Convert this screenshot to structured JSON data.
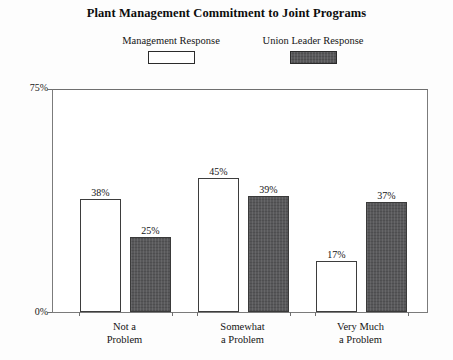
{
  "chart_data": {
    "type": "bar",
    "title": "Plant Management Commitment to Joint Programs",
    "xlabel": "",
    "ylabel": "",
    "ylim": [
      0,
      75
    ],
    "grid": false,
    "legend_position": "top",
    "categories": [
      "Not a Problem",
      "Somewhat a Problem",
      "Very Much a Problem"
    ],
    "category_lines": [
      [
        "Not a",
        "Problem"
      ],
      [
        "Somewhat",
        "a Problem"
      ],
      [
        "Very Much",
        "a Problem"
      ]
    ],
    "y_ticks": [
      "0%",
      "75%"
    ],
    "y_tick_values": [
      0,
      75
    ],
    "series": [
      {
        "name": "Management Response",
        "values": [
          38,
          45,
          17
        ],
        "labels": [
          "38%",
          "45%",
          "17%"
        ],
        "fill": "#ffffff",
        "stroke": "#3d3d3d"
      },
      {
        "name": "Union Leader Response",
        "values": [
          25,
          39,
          37
        ],
        "labels": [
          "25%",
          "39%",
          "37%"
        ],
        "fill": "#58585a",
        "stroke": "#3a3a3a"
      }
    ]
  },
  "legend": {
    "entries": [
      {
        "label": "Management Response"
      },
      {
        "label": "Union Leader Response"
      }
    ]
  },
  "axis": {
    "y_top_label": "75%",
    "y_bottom_label": "0%"
  }
}
